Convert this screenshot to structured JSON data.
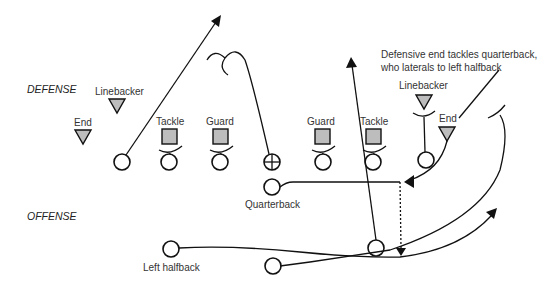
{
  "diagram": {
    "sides": {
      "defense": "DEFENSE",
      "offense": "OFFENSE"
    },
    "annotation": {
      "line1": "Defensive end tackles quarterback,",
      "line2": "who laterals to left halfback"
    },
    "defense_labels": {
      "left_end": "End",
      "left_linebacker": "Linebacker",
      "left_tackle": "Tackle",
      "left_guard": "Guard",
      "right_guard": "Guard",
      "right_tackle": "Tackle",
      "right_linebacker": "Linebacker",
      "right_end": "End"
    },
    "offense_labels": {
      "quarterback": "Quarterback",
      "left_halfback": "Left halfback"
    },
    "colors": {
      "defender_fill": "#bdbdbd",
      "stroke": "#111111",
      "text": "#333333"
    }
  }
}
